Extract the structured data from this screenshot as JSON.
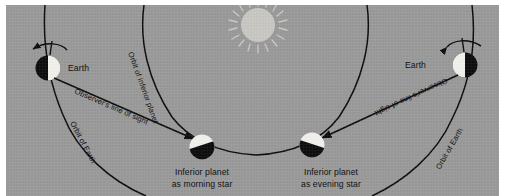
{
  "figure": {
    "background_color": "#9a9a9a",
    "border_color": "#ffffff",
    "ink_color": "#0d0d0d",
    "lit_color": "#f2f1ec",
    "dark_color": "#0d0d0d"
  },
  "bodies": {
    "sun": {
      "label": "sun",
      "cx": 252,
      "cy": 20,
      "r": 17,
      "rays": 16
    },
    "earth_left": {
      "label": "Earth",
      "cx": 42,
      "cy": 63,
      "r": 12.5,
      "lit_side": "right"
    },
    "earth_right": {
      "label": "Earth",
      "cx": 459,
      "cy": 60,
      "r": 12.5,
      "lit_side": "left"
    },
    "planet_morning": {
      "label_line1": "Inferior planet",
      "label_line2": "as morning star",
      "cx": 196,
      "cy": 142,
      "r": 12.5,
      "lit_side": "upper-left"
    },
    "planet_evening": {
      "label_line1": "Inferior planet",
      "label_line2": "as evening star",
      "cx": 306,
      "cy": 140,
      "r": 12.5,
      "lit_side": "upper-right"
    }
  },
  "labels": {
    "earth_left": "Earth",
    "earth_right": "Earth",
    "orbit_of_earth_left": "Orbit of Earth",
    "orbit_of_earth_right": "Orbit of Earth",
    "orbit_of_inferior_planet": "Orbit of inferior planet",
    "line_of_sight_left": "Observer's line of sight",
    "line_of_sight_right": "Observer's line of sight",
    "morning_star_line1": "Inferior planet",
    "morning_star_line2": "as morning star",
    "evening_star_line1": "Inferior planet",
    "evening_star_line2": "as evening star"
  },
  "arrows": {
    "rotation_left": "counterclockwise rotation arrow above left Earth",
    "rotation_right": "counterclockwise rotation arrow above right Earth",
    "sight_left_target": "inferior planet as morning star",
    "sight_right_target": "inferior planet as evening star"
  }
}
